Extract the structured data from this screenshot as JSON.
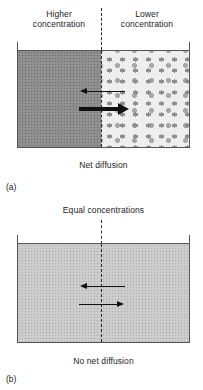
{
  "figure": {
    "colors": {
      "high_concentration_fill": "#8d8d8d",
      "low_concentration_fill": "#eeeeee",
      "equal_concentration_fill": "#cacaca",
      "border": "#555555",
      "arrow": "#111111",
      "divider": "#2a2a2a",
      "text": "#1c1c1c",
      "background": "#ffffff"
    }
  },
  "panel_a": {
    "tag": "(a)",
    "left_label": "Higher\nconcentration",
    "right_label": "Lower\nconcentration",
    "caption": "Net diffusion",
    "divider_style": "dashed",
    "arrows": [
      {
        "name": "leftward-flux-arrow",
        "direction": "left",
        "weight": "thin",
        "meaning": "smaller flux from low to high concentration"
      },
      {
        "name": "rightward-flux-arrow",
        "direction": "right",
        "weight": "thick",
        "meaning": "larger flux from high to low concentration"
      }
    ]
  },
  "panel_b": {
    "tag": "(b)",
    "top_label": "Equal concentrations",
    "caption": "No net diffusion",
    "divider_style": "dashed",
    "arrows": [
      {
        "name": "leftward-flux-arrow",
        "direction": "left",
        "weight": "thin",
        "meaning": "equal flux right to left"
      },
      {
        "name": "rightward-flux-arrow",
        "direction": "right",
        "weight": "thin",
        "meaning": "equal flux left to right"
      }
    ]
  }
}
